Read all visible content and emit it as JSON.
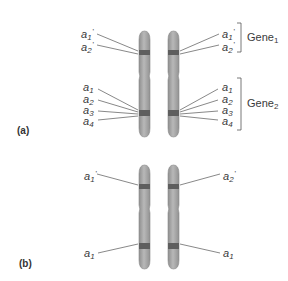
{
  "panels": {
    "a": {
      "label": "(a)",
      "left_labels": [
        {
          "base": "a",
          "sub": "1",
          "prime": "'"
        },
        {
          "base": "a",
          "sub": "2",
          "prime": "'"
        },
        {
          "base": "a",
          "sub": "1",
          "prime": ""
        },
        {
          "base": "a",
          "sub": "2",
          "prime": ""
        },
        {
          "base": "a",
          "sub": "3",
          "prime": ""
        },
        {
          "base": "a",
          "sub": "4",
          "prime": ""
        }
      ],
      "right_labels": [
        {
          "base": "a",
          "sub": "1",
          "prime": "'"
        },
        {
          "base": "a",
          "sub": "2",
          "prime": "'"
        },
        {
          "base": "a",
          "sub": "1",
          "prime": ""
        },
        {
          "base": "a",
          "sub": "2",
          "prime": ""
        },
        {
          "base": "a",
          "sub": "3",
          "prime": ""
        },
        {
          "base": "a",
          "sub": "4",
          "prime": ""
        }
      ],
      "genes": [
        {
          "base": "Gene",
          "sub": "1"
        },
        {
          "base": "Gene",
          "sub": "2"
        }
      ]
    },
    "b": {
      "label": "(b)",
      "left_labels": [
        {
          "base": "a",
          "sub": "1",
          "prime": "'"
        },
        {
          "base": "a",
          "sub": "1",
          "prime": ""
        }
      ],
      "right_labels": [
        {
          "base": "a",
          "sub": "2",
          "prime": "'"
        },
        {
          "base": "a",
          "sub": "1",
          "prime": ""
        }
      ]
    }
  },
  "colors": {
    "chromosome_fill": "#a9a9a9",
    "chromosome_edge": "#8a8a8a",
    "band": "#5e5e5e",
    "line": "#555555"
  }
}
